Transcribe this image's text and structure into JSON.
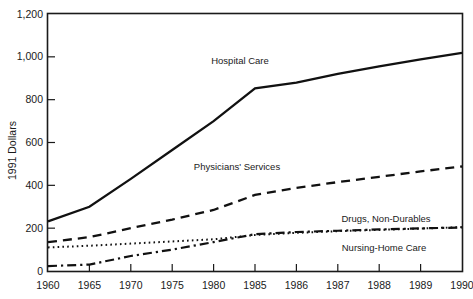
{
  "chart_data": {
    "type": "line",
    "title": "",
    "xlabel": "",
    "ylabel": "1991 Dollars",
    "categories": [
      "1960",
      "1965",
      "1970",
      "1975",
      "1980",
      "1985",
      "1986",
      "1987",
      "1988",
      "1989",
      "1990"
    ],
    "ylim": [
      0,
      1200
    ],
    "yticks": [
      0,
      200,
      400,
      600,
      800,
      1000,
      1200
    ],
    "ytick_labels": [
      "0",
      "200",
      "400",
      "600",
      "800",
      "1,000",
      "1,200"
    ],
    "grid": false,
    "legend": "inline-annotations",
    "series": [
      {
        "name": "Hospital Care",
        "style": "solid",
        "values": [
          232,
          300,
          430,
          565,
          700,
          853,
          880,
          920,
          955,
          988,
          1018
        ]
      },
      {
        "name": "Physicians' Services",
        "style": "dashed",
        "values": [
          135,
          158,
          200,
          240,
          285,
          355,
          388,
          415,
          440,
          465,
          488
        ]
      },
      {
        "name": "Drugs, Non-Durables",
        "style": "dotted",
        "values": [
          110,
          118,
          128,
          138,
          148,
          168,
          178,
          186,
          192,
          198,
          205
        ]
      },
      {
        "name": "Nursing-Home Care",
        "style": "dashdot",
        "values": [
          23,
          30,
          70,
          100,
          135,
          172,
          182,
          188,
          194,
          199,
          203
        ]
      }
    ],
    "annotations": [
      {
        "text": "Hospital Care",
        "x_px": 240,
        "y_px": 64
      },
      {
        "text": "Physicians' Services",
        "x_px": 237,
        "y_px": 170
      },
      {
        "text": "Drugs, Non-Durables",
        "x_px": 386,
        "y_px": 222
      },
      {
        "text": "Nursing-Home Care",
        "x_px": 384,
        "y_px": 251
      }
    ],
    "colors": {
      "line": "#111111",
      "axis": "#1a1a1a",
      "background": "#ffffff"
    }
  }
}
